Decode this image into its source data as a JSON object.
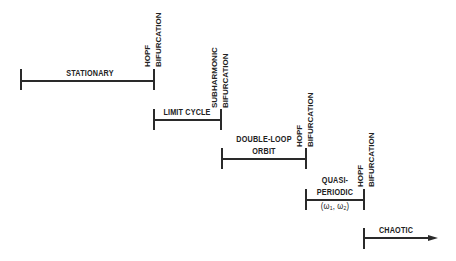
{
  "diagram": {
    "title": "",
    "regimes": [
      {
        "id": "stationary",
        "lines": [
          "STATIONARY"
        ]
      },
      {
        "id": "limit-cycle",
        "lines": [
          "LIMIT CYCLE"
        ]
      },
      {
        "id": "double-loop-orbit",
        "lines": [
          "DOUBLE-LOOP",
          "ORBIT"
        ]
      },
      {
        "id": "quasi-periodic",
        "lines": [
          "QUASI-",
          "PERIODIC"
        ],
        "subtitle": {
          "open": "(",
          "w1": "ω",
          "s1": "1",
          "sep": ", ",
          "w2": "ω",
          "s2": "2",
          "close": ")"
        }
      },
      {
        "id": "chaotic",
        "lines": [
          "CHAOTIC"
        ]
      }
    ],
    "transitions": [
      {
        "id": "hopf-1",
        "lines": [
          "HOPF",
          "BIFURCATION"
        ]
      },
      {
        "id": "subharmonic",
        "lines": [
          "SUBHARMONIC",
          "BIFURCATION"
        ]
      },
      {
        "id": "hopf-2",
        "lines": [
          "HOPF",
          "BIFURCATION"
        ]
      },
      {
        "id": "hopf-3",
        "lines": [
          "HOPF",
          "BIFURCATION"
        ]
      }
    ],
    "colors": {
      "ink": "#2a2a2a",
      "background": "#ffffff"
    }
  }
}
